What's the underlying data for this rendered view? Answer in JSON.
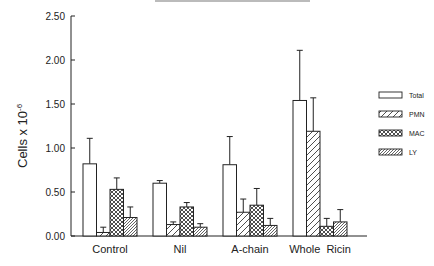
{
  "chart_data": {
    "type": "bar",
    "title": "",
    "xlabel": "",
    "ylabel": "Cells x 10^-6",
    "ylabel_parts": {
      "main": "Cells  x  10",
      "exp": "-6"
    },
    "ylim": [
      0,
      2.5
    ],
    "yticks": [
      "0.00",
      "0.50",
      "1.00",
      "1.50",
      "2.00",
      "2.50"
    ],
    "grid": false,
    "legend_position": "right",
    "categories": [
      "Control",
      "Nil",
      "A-chain",
      "Whole  Ricin"
    ],
    "series": [
      {
        "name": "Total",
        "pattern": "open",
        "values": [
          0.82,
          0.6,
          0.81,
          1.54
        ],
        "error_top": [
          1.11,
          0.63,
          1.13,
          2.11
        ]
      },
      {
        "name": "PMN",
        "pattern": "wide-diagonal",
        "values": [
          0.04,
          0.13,
          0.27,
          1.19
        ],
        "error_top": [
          0.1,
          0.16,
          0.42,
          1.57
        ]
      },
      {
        "name": "MAC",
        "pattern": "crosshatch",
        "values": [
          0.53,
          0.33,
          0.35,
          0.11
        ],
        "error_top": [
          0.66,
          0.38,
          0.54,
          0.2
        ]
      },
      {
        "name": "LY",
        "pattern": "dense-diagonal",
        "values": [
          0.21,
          0.1,
          0.12,
          0.16
        ],
        "error_top": [
          0.33,
          0.14,
          0.2,
          0.3
        ]
      }
    ]
  }
}
